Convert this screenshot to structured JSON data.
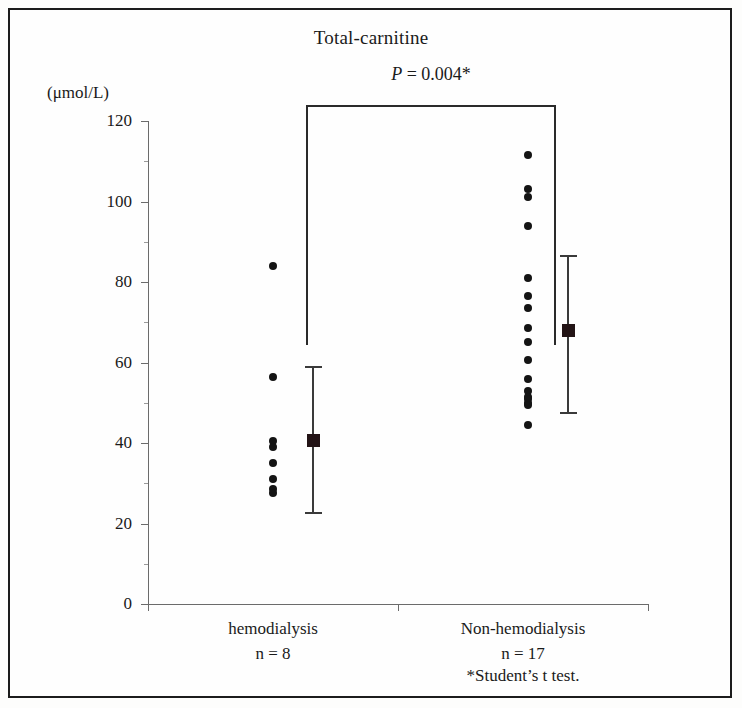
{
  "figure": {
    "title": "Total-carnitine",
    "unit_label": "(μmol/L)",
    "significance_label_italic": "P",
    "significance_label_rest": " = 0.004*",
    "footnote": "*Student’s t test.",
    "border_color": "#1c1c1c",
    "dot_color": "#141414",
    "errorbar_color": "#3a3a3a",
    "axis_color": "#6b6b6b"
  },
  "chart_data": {
    "type": "scatter",
    "title": "Total-carnitine",
    "xlabel": "",
    "ylabel": "(μmol/L)",
    "ylim": [
      0,
      120
    ],
    "yticks": [
      0,
      20,
      40,
      60,
      80,
      100,
      120
    ],
    "ytick_labels": [
      "0",
      "20",
      "40",
      "60",
      "80",
      "100",
      "120"
    ],
    "y_minor_ticks": [
      10,
      30,
      50,
      70,
      90,
      110
    ],
    "grid": false,
    "legend": "none",
    "annotations": [
      {
        "text": "P = 0.004*",
        "kind": "significance-bracket",
        "between": [
          "hemodialysis",
          "Non-hemodialysis"
        ]
      },
      {
        "text": "*Student’s t test.",
        "kind": "footnote"
      }
    ],
    "groups": [
      {
        "name": "hemodialysis",
        "label": "hemodialysis",
        "n_label": "n = 8",
        "n": 8,
        "values": [
          84.0,
          56.5,
          40.5,
          39.0,
          35.0,
          31.0,
          28.5,
          27.5
        ],
        "mean": 40.5,
        "sd_upper": 59.0,
        "sd_lower": 22.5
      },
      {
        "name": "Non-hemodialysis",
        "label": "Non-hemodialysis",
        "n_label": "n = 17",
        "n": 17,
        "values": [
          111.5,
          103.0,
          101.0,
          94.0,
          81.0,
          76.5,
          73.5,
          68.5,
          65.0,
          60.5,
          56.0,
          53.0,
          51.5,
          51.0,
          50.0,
          49.5,
          44.5
        ],
        "mean": 68.0,
        "sd_upper": 86.5,
        "sd_lower": 47.5
      }
    ]
  },
  "axis_geometry": {
    "y_top_px": 121,
    "y_bottom_px": 604,
    "x_left_px": 148,
    "x_right_px": 648,
    "group_x_px": [
      273,
      528
    ],
    "errorbar_x_px": [
      313,
      568
    ],
    "category_divider_px": 398
  }
}
